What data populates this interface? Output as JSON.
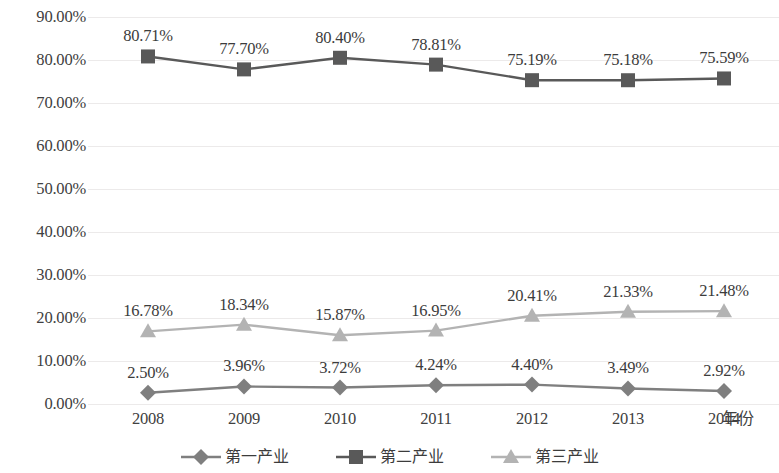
{
  "chart_data": {
    "type": "line",
    "title": "",
    "xlabel": "年份",
    "ylabel": "",
    "categories": [
      "2008",
      "2009",
      "2010",
      "2011",
      "2012",
      "2013",
      "2014"
    ],
    "ylim": [
      0,
      90
    ],
    "y_ticks": [
      "0.00%",
      "10.00%",
      "20.00%",
      "30.00%",
      "40.00%",
      "50.00%",
      "60.00%",
      "70.00%",
      "80.00%",
      "90.00%"
    ],
    "y_tick_values": [
      0,
      10,
      20,
      30,
      40,
      50,
      60,
      70,
      80,
      90
    ],
    "grid": true,
    "legend_position": "bottom",
    "series": [
      {
        "name": "第一产业",
        "marker": "diamond",
        "color": "#7f7f7f",
        "values": [
          2.5,
          3.96,
          3.72,
          4.24,
          4.4,
          3.49,
          2.92
        ],
        "labels": [
          "2.50%",
          "3.96%",
          "3.72%",
          "4.24%",
          "4.40%",
          "3.49%",
          "2.92%"
        ]
      },
      {
        "name": "第二产业",
        "marker": "square",
        "color": "#595959",
        "values": [
          80.71,
          77.7,
          80.4,
          78.81,
          75.19,
          75.18,
          75.59
        ],
        "labels": [
          "80.71%",
          "77.70%",
          "80.40%",
          "78.81%",
          "75.19%",
          "75.18%",
          "75.59%"
        ]
      },
      {
        "name": "第三产业",
        "marker": "triangle",
        "color": "#b3b3b3",
        "values": [
          16.78,
          18.34,
          15.87,
          16.95,
          20.41,
          21.33,
          21.48
        ],
        "labels": [
          "16.78%",
          "18.34%",
          "15.87%",
          "16.95%",
          "20.41%",
          "21.33%",
          "21.48%"
        ]
      }
    ]
  }
}
